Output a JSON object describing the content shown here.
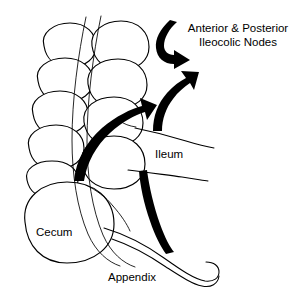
{
  "figure": {
    "type": "anatomical-diagram",
    "background_color": "#ffffff",
    "ink_color": "#000000"
  },
  "labels": {
    "nodes_line1": "Anterior & Posterior",
    "nodes_line2": "Ileocolic Nodes",
    "ileum": "Ileum",
    "cecum": "Cecum",
    "appendix": "Appendix"
  },
  "structures": [
    {
      "name": "ascending-colon",
      "description": "Chain of haustral sacculations running vertically on the left"
    },
    {
      "name": "cecum",
      "description": "Large rounded sac at the lower left"
    },
    {
      "name": "appendix",
      "description": "Slender curved tube running from the cecum toward the lower right"
    },
    {
      "name": "terminal-ileum",
      "description": "Tube entering the colon from the right"
    },
    {
      "name": "taenia-coli",
      "description": "Two longitudinal bands drawn over the colon"
    }
  ],
  "arrows": [
    {
      "name": "hook-arrow-to-nodes",
      "direction": "curves left then right, head pointing right",
      "meaning": "lymph flow to ileocolic nodes"
    },
    {
      "name": "ileal-arrow-to-nodes",
      "direction": "curves up and to the right, head pointing up-right",
      "meaning": "lymph flow from ileum"
    },
    {
      "name": "colic-arrow-to-nodes",
      "direction": "sweeps up from lower left to upper right, head pointing up-right",
      "meaning": "lymph flow from colon and cecum"
    },
    {
      "name": "appendiceal-arrow",
      "direction": "runs up from lower right, tapering tail",
      "meaning": "lymph flow from appendix"
    }
  ],
  "colors": {
    "ink": "#000000",
    "paper": "#ffffff"
  }
}
